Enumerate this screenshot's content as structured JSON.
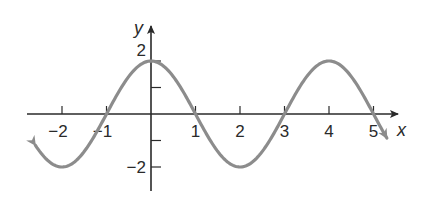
{
  "chart_data": {
    "type": "line",
    "title": "",
    "xlabel": "x",
    "ylabel": "y",
    "function": "y = 2cos(πx/2)",
    "xlim": [
      -2.6,
      5.3
    ],
    "ylim": [
      -2,
      2
    ],
    "grid": false,
    "legend": null,
    "x_ticks": [
      -2,
      -1,
      1,
      2,
      3,
      4,
      5
    ],
    "x_tick_labels": [
      "−2",
      "−1",
      "1",
      "2",
      "3",
      "4",
      "5"
    ],
    "y_ticks": [
      2,
      1,
      -1,
      -2
    ],
    "y_tick_labels": [
      "2",
      "",
      "",
      "−2"
    ],
    "series": [
      {
        "name": "curve",
        "color": "#8c8c8c",
        "x": [
          -2.6,
          -2,
          -1,
          0,
          1,
          2,
          3,
          4,
          5,
          5.3
        ],
        "y": [
          -1.18,
          -2,
          0,
          2,
          0,
          -2,
          0,
          2,
          0,
          -0.91
        ],
        "arrows_both_ends": true
      }
    ],
    "key_points": {
      "maxima": [
        [
          0,
          2
        ],
        [
          4,
          2
        ]
      ],
      "minima": [
        [
          -2,
          -2
        ],
        [
          2,
          -2
        ]
      ],
      "zeros": [
        -1,
        1,
        3,
        5
      ]
    }
  },
  "axes": {
    "x_label": "x",
    "y_label": "y",
    "axis_color": "#2a2a2a",
    "curve_color": "#8c8c8c"
  }
}
